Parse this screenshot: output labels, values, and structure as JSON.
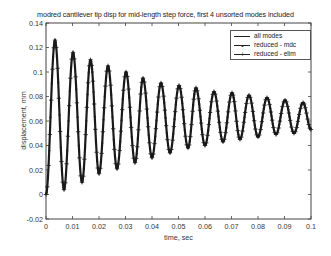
{
  "chart_data": {
    "type": "line",
    "title": "modred cantilever tip disp for mid-length step force, first 4 unsorted modes included",
    "xlabel": "time, sec",
    "ylabel": "displacement, mm",
    "xlim": [
      0,
      0.1
    ],
    "ylim": [
      -0.02,
      0.14
    ],
    "xticks": [
      "0",
      "0.01",
      "0.02",
      "0.03",
      "0.04",
      "0.05",
      "0.06",
      "0.07",
      "0.08",
      "0.09",
      "0.1"
    ],
    "yticks": [
      "-0.02",
      "0",
      "0.02",
      "0.04",
      "0.06",
      "0.08",
      "0.1",
      "0.12",
      "0.14"
    ],
    "grid": false,
    "legend_position": "upper right",
    "legend": [
      "all modes",
      "reduced - mdc",
      "reduced - elim"
    ],
    "series": [
      {
        "name": "all modes",
        "style": "solid line"
      },
      {
        "name": "reduced - mdc",
        "style": "line with dot markers"
      },
      {
        "name": "reduced - elim",
        "style": "line with plus markers"
      }
    ],
    "oscillation": {
      "description": "Damped oscillation starting at 0, all three series overlap",
      "period_sec": 0.0067,
      "peaks": {
        "x": [
          0.0034,
          0.0102,
          0.0168,
          0.0234,
          0.0302,
          0.0366,
          0.0434,
          0.0502,
          0.0566,
          0.0634,
          0.0702,
          0.0766,
          0.0834,
          0.0902,
          0.097
        ],
        "y": [
          0.126,
          0.116,
          0.11,
          0.105,
          0.1,
          0.095,
          0.091,
          0.089,
          0.087,
          0.084,
          0.083,
          0.081,
          0.079,
          0.077,
          0.075
        ]
      },
      "troughs": {
        "x": [
          0.0068,
          0.0136,
          0.02,
          0.0268,
          0.0336,
          0.04,
          0.0468,
          0.0536,
          0.06,
          0.0668,
          0.0732,
          0.08,
          0.0868,
          0.0936
        ],
        "y": [
          0.004,
          0.01,
          0.017,
          0.021,
          0.026,
          0.03,
          0.034,
          0.038,
          0.04,
          0.043,
          0.045,
          0.047,
          0.049,
          0.05
        ]
      },
      "start": [
        0,
        0
      ],
      "end": [
        0.1,
        0.053
      ]
    }
  },
  "colors": {
    "line": "#1a1a1a",
    "axes": "#444444",
    "background": "#ffffff"
  }
}
